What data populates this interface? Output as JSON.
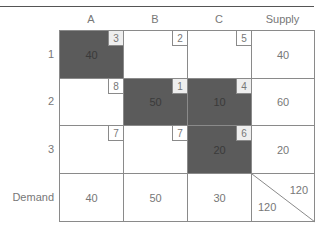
{
  "columns": [
    "A",
    "B",
    "C",
    "Supply"
  ],
  "rows": [
    {
      "label": "1",
      "cells": [
        {
          "cost": "3",
          "alloc": "40",
          "filled": true
        },
        {
          "cost": "2",
          "alloc": "",
          "filled": false
        },
        {
          "cost": "5",
          "alloc": "",
          "filled": false
        }
      ],
      "supply": "40"
    },
    {
      "label": "2",
      "cells": [
        {
          "cost": "8",
          "alloc": "",
          "filled": false
        },
        {
          "cost": "1",
          "alloc": "50",
          "filled": true
        },
        {
          "cost": "4",
          "alloc": "10",
          "filled": true
        }
      ],
      "supply": "60"
    },
    {
      "label": "3",
      "cells": [
        {
          "cost": "7",
          "alloc": "",
          "filled": false
        },
        {
          "cost": "7",
          "alloc": "",
          "filled": false
        },
        {
          "cost": "6",
          "alloc": "20",
          "filled": true
        }
      ],
      "supply": "20"
    }
  ],
  "demand": {
    "label": "Demand",
    "values": [
      "40",
      "50",
      "30"
    ]
  },
  "totals": {
    "supply_total": "120",
    "demand_total": "120"
  },
  "colors": {
    "allocated_fill": "#5b5b5b",
    "grid_line": "#8a8a8a"
  }
}
